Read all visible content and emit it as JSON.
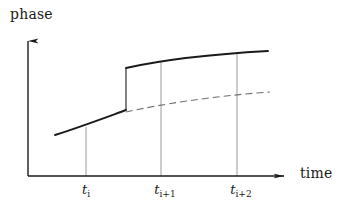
{
  "figure": {
    "width": 341,
    "height": 205,
    "background": "#ffffff",
    "ink_color": "#1a1a1a",
    "thin_line_color": "#9a9a9a",
    "dashed_line_color": "#6f6f6f"
  },
  "axes": {
    "y_axis_label": "phase",
    "x_axis_label": "time",
    "origin": {
      "x": 28,
      "y": 176
    },
    "x_axis_end": {
      "x": 295,
      "y": 176
    },
    "y_axis_top": {
      "x": 28,
      "y": 30
    },
    "arrowheads": true,
    "grid": false,
    "tick_marks_on_axis": false
  },
  "ticks": [
    {
      "id": "t-i",
      "label_var": "t",
      "label_sub": "i",
      "x": 86,
      "guide_top_y": 127
    },
    {
      "id": "t-i+1",
      "label_var": "t",
      "label_sub": "i+1",
      "x": 161,
      "guide_top_y": 62
    },
    {
      "id": "t-i+2",
      "label_var": "t",
      "label_sub": "i+2",
      "x": 237,
      "guide_top_y": 53
    }
  ],
  "chart_data": {
    "type": "line",
    "title": "",
    "xlabel": "time",
    "ylabel": "phase",
    "grid": false,
    "legend": "none",
    "annotations": [
      "phase jump (discontinuity) occurs between t_i and t_i+1",
      "dashed branch is the continuation of the pre-jump phase trend"
    ],
    "series": [
      {
        "name": "phase-with-jump",
        "style": "solid",
        "color": "#1a1a1a",
        "width": 1.9,
        "segments": [
          {
            "name": "pre-jump",
            "path": "M 55 135 C 80 127, 104 118, 126 110"
          },
          {
            "name": "jump",
            "path": "M 126 110 L 126 68"
          },
          {
            "name": "post-jump",
            "path": "M 126 68 C 162 60, 214 54, 268 51"
          }
        ]
      },
      {
        "name": "phase-unwrapped-reference",
        "style": "dashed",
        "color": "#6f6f6f",
        "width": 1.1,
        "dash": "7 4",
        "segments": [
          {
            "name": "dashed-continuation",
            "path": "M 126 112 C 162 104, 214 96, 270 92"
          }
        ]
      }
    ],
    "x_tick_labels": [
      "t_i",
      "t_i+1",
      "t_i+2"
    ],
    "x_tick_positions": [
      86,
      161,
      237
    ],
    "y_tick_labels": []
  }
}
